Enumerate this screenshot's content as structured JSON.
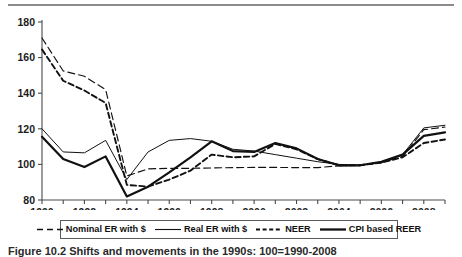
{
  "figure": {
    "caption": "Figure 10.2  Shifts and movements in the 1990s: 100=1990-2008"
  },
  "legend": {
    "items": [
      {
        "label": "Nominal ER with $",
        "style": "long-dash",
        "icon": "legend-line-dashed-long"
      },
      {
        "label": "Real ER with $",
        "style": "thin-solid",
        "icon": "legend-line-solid-thin"
      },
      {
        "label": "NEER",
        "style": "short-dash-bold",
        "icon": "legend-line-dashed-short"
      },
      {
        "label": "CPI based REER",
        "style": "thick-solid",
        "icon": "legend-line-solid-thick"
      }
    ]
  },
  "chart_data": {
    "type": "line",
    "title": "",
    "xlabel": "",
    "ylabel": "",
    "xlim": [
      1990,
      2009
    ],
    "ylim": [
      80,
      180
    ],
    "ytick_values": [
      80,
      100,
      120,
      140,
      160,
      180
    ],
    "ytick_labels": [
      "80",
      "100",
      "120",
      "140",
      "160",
      "180"
    ],
    "xtick_values": [
      1990,
      1991,
      1992,
      1993,
      1994,
      1995,
      1996,
      1997,
      1998,
      1999,
      2000,
      2001,
      2002,
      2003,
      2004,
      2005,
      2006,
      2007,
      2008,
      2009
    ],
    "xtick_labels": [
      "1990",
      "",
      "1992",
      "",
      "1994",
      "",
      "1996",
      "",
      "1998",
      "",
      "2000",
      "",
      "2002",
      "",
      "2004",
      "",
      "2006",
      "",
      "2008",
      ""
    ],
    "grid": false,
    "legend_position": "bottom",
    "x": [
      1990,
      1991,
      1992,
      1993,
      1994,
      1995,
      1996,
      1997,
      1998,
      1999,
      2000,
      2001,
      2002,
      2003,
      2004,
      2005,
      2006,
      2007,
      2008,
      2009
    ],
    "series": [
      {
        "name": "Nominal ER with $",
        "values": [
          171.0,
          152.5,
          149.5,
          142.0,
          93.5,
          97.5,
          97.8,
          97.8,
          98.0,
          98.2,
          98.3,
          98.3,
          98.2,
          98.2,
          99.2,
          99.5,
          101.0,
          104.5,
          119.5,
          121.0
        ]
      },
      {
        "name": "Real ER with $",
        "values": [
          120.0,
          107.0,
          106.5,
          113.5,
          91.5,
          107.0,
          113.5,
          114.5,
          113.0,
          108.5,
          107.5,
          105.5,
          103.5,
          101.5,
          100.0,
          99.5,
          101.0,
          105.5,
          120.5,
          122.0
        ]
      },
      {
        "name": "NEER",
        "values": [
          164.5,
          147.0,
          141.5,
          134.5,
          88.5,
          87.5,
          91.5,
          96.5,
          105.5,
          104.0,
          104.5,
          111.5,
          108.5,
          103.0,
          99.5,
          99.5,
          101.0,
          104.0,
          112.0,
          114.0
        ]
      },
      {
        "name": "CPI based REER",
        "values": [
          115.5,
          103.0,
          98.5,
          104.5,
          82.0,
          87.5,
          95.5,
          104.0,
          113.0,
          107.5,
          107.0,
          112.0,
          109.0,
          103.0,
          99.5,
          99.5,
          101.5,
          105.5,
          116.0,
          118.0
        ]
      }
    ]
  }
}
